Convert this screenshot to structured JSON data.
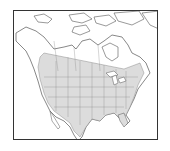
{
  "map": {
    "region": "North America",
    "type": "species range map",
    "colors": {
      "background": "#ffffff",
      "land": "#ffffff",
      "range_fill": "#dcdcdc",
      "borders": "#555555",
      "frame": "#333333"
    }
  }
}
